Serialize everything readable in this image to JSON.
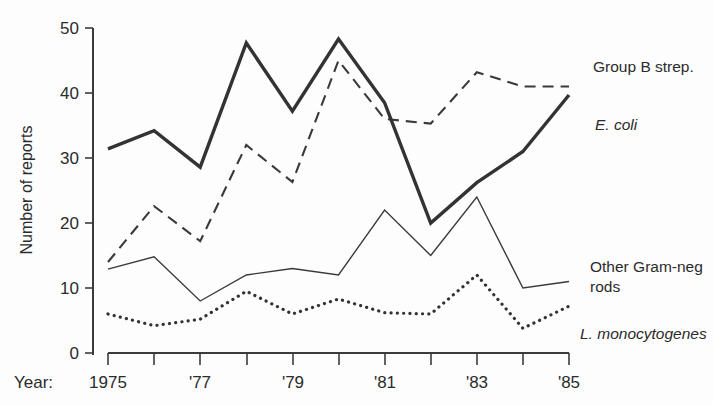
{
  "chart_data": {
    "type": "line",
    "title": "",
    "xlabel": "Year:",
    "ylabel": "Number of reports",
    "x": [
      1975,
      1976,
      1977,
      1978,
      1979,
      1980,
      1981,
      1982,
      1983,
      1984,
      1985
    ],
    "xtick_labels": [
      "1975",
      "",
      "'77",
      "",
      "'79",
      "",
      "'81",
      "",
      "'83",
      "",
      "'85"
    ],
    "ytick_labels": [
      "0",
      "10",
      "20",
      "30",
      "40",
      "50"
    ],
    "yticks": [
      0,
      10,
      20,
      30,
      40,
      50
    ],
    "ylim": [
      0,
      50
    ],
    "xlim": [
      1975,
      1985
    ],
    "grid": false,
    "legend_position": "inline-right-end-labels",
    "series": [
      {
        "name": "E. coli",
        "label": "E. coli",
        "label_style": "italic",
        "line_style": "thick-solid",
        "color": "#333333",
        "values": [
          31.4,
          34.2,
          28.6,
          47.7,
          37.2,
          48.3,
          38.5,
          20.0,
          26.2,
          31.0,
          39.7
        ]
      },
      {
        "name": "Group B strep.",
        "label": "Group B strep.",
        "label_style": "roman",
        "line_style": "dashed",
        "color": "#3a3a3a",
        "values": [
          14.0,
          22.6,
          17.2,
          32.0,
          26.3,
          45.0,
          36.0,
          35.3,
          43.2,
          41.0,
          41.0
        ]
      },
      {
        "name": "Other Gram-neg rods",
        "label": "Other Gram-neg rods",
        "label_style": "roman",
        "line_style": "thin-solid",
        "color": "#3a3a3a",
        "values": [
          12.9,
          14.8,
          8.0,
          12.0,
          13.0,
          12.0,
          22.0,
          15.0,
          24.0,
          10.0,
          11.0
        ]
      },
      {
        "name": "L. monocytogenes",
        "label": "L. monocytogenes",
        "label_style": "italic",
        "line_style": "dotted",
        "color": "#333333",
        "values": [
          6.0,
          4.2,
          5.2,
          9.5,
          6.0,
          8.3,
          6.2,
          6.0,
          12.0,
          3.8,
          7.2
        ]
      }
    ],
    "annotations": [
      {
        "text": "Group B strep.",
        "x": 593,
        "y": 72
      },
      {
        "text": "E. coli",
        "x": 595,
        "y": 130
      },
      {
        "text": "Other Gram-neg",
        "x": 590,
        "y": 272
      },
      {
        "text": "rods",
        "x": 590,
        "y": 292
      },
      {
        "text": "L. monocytogenes",
        "x": 580,
        "y": 339
      }
    ]
  }
}
